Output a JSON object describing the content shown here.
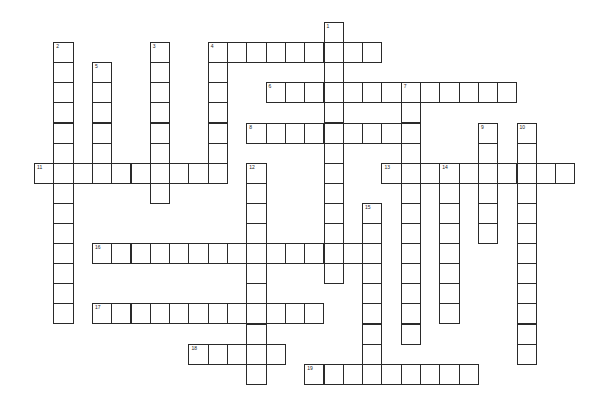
{
  "puzzle": {
    "type": "crossword",
    "cell_width": 19.3,
    "cell_height": 20.1,
    "origin_x": 34,
    "origin_y": 22,
    "colors": {
      "border": "#2a2a2a",
      "background": "#ffffff",
      "number": "#222222"
    },
    "words": [
      {
        "number": "1",
        "direction": "down",
        "col": 15,
        "row": 0,
        "length": 13
      },
      {
        "number": "2",
        "direction": "down",
        "col": 1,
        "row": 1,
        "length": 14
      },
      {
        "number": "3",
        "direction": "down",
        "col": 6,
        "row": 1,
        "length": 8
      },
      {
        "number": "4",
        "direction": "across",
        "col": 9,
        "row": 1,
        "length": 9
      },
      {
        "number": "4",
        "direction": "down",
        "col": 9,
        "row": 1,
        "length": 7
      },
      {
        "number": "5",
        "direction": "down",
        "col": 3,
        "row": 2,
        "length": 6
      },
      {
        "number": "6",
        "direction": "across",
        "col": 12,
        "row": 3,
        "length": 13
      },
      {
        "number": "7",
        "direction": "down",
        "col": 19,
        "row": 3,
        "length": 13
      },
      {
        "number": "8",
        "direction": "across",
        "col": 11,
        "row": 5,
        "length": 9
      },
      {
        "number": "9",
        "direction": "down",
        "col": 23,
        "row": 5,
        "length": 6
      },
      {
        "number": "10",
        "direction": "down",
        "col": 25,
        "row": 5,
        "length": 12
      },
      {
        "number": "11",
        "direction": "across",
        "col": 0,
        "row": 7,
        "length": 10
      },
      {
        "number": "12",
        "direction": "down",
        "col": 11,
        "row": 7,
        "length": 11
      },
      {
        "number": "13",
        "direction": "across",
        "col": 18,
        "row": 7,
        "length": 10
      },
      {
        "number": "14",
        "direction": "down",
        "col": 21,
        "row": 7,
        "length": 8
      },
      {
        "number": "15",
        "direction": "down",
        "col": 17,
        "row": 9,
        "length": 9
      },
      {
        "number": "16",
        "direction": "across",
        "col": 3,
        "row": 11,
        "length": 15
      },
      {
        "number": "17",
        "direction": "across",
        "col": 3,
        "row": 14,
        "length": 12
      },
      {
        "number": "18",
        "direction": "across",
        "col": 8,
        "row": 16,
        "length": 5
      },
      {
        "number": "19",
        "direction": "across",
        "col": 14,
        "row": 17,
        "length": 9
      }
    ]
  }
}
